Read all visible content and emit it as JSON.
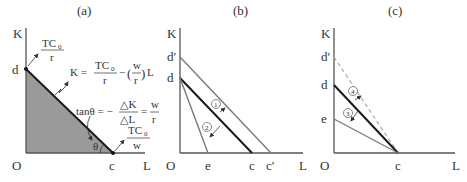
{
  "panels": {
    "a": {
      "title": "(a)",
      "axis_y": "K",
      "axis_x": "L",
      "origin": "O",
      "point_d": "d",
      "point_c": "c",
      "intercept_d_num": "TC",
      "intercept_d_sub": "0",
      "intercept_d_den": "r",
      "intercept_c_num": "TC",
      "intercept_c_sub": "0",
      "intercept_c_den": "w",
      "eq_lhs": "K =",
      "eq_frac_num": "TC",
      "eq_frac_sub": "0",
      "eq_frac_den": "r",
      "eq_minus": "−",
      "eq_w": "w",
      "eq_r": "r",
      "eq_L": "L",
      "tan_lhs": "tanθ = −",
      "tan_num": "△K",
      "tan_den": "△L",
      "tan_eq": "=",
      "tan_w": "w",
      "tan_r": "r",
      "theta": "θ"
    },
    "b": {
      "title": "(b)",
      "axis_y": "K",
      "axis_x": "L",
      "origin": "O",
      "point_d_prime": "d′",
      "point_d": "d",
      "point_e": "e",
      "point_c": "c",
      "point_c_prime": "c′",
      "marker_1": "1",
      "marker_2": "2"
    },
    "c": {
      "title": "(c)",
      "axis_y": "K",
      "axis_x": "L",
      "origin": "O",
      "point_d_prime": "d′",
      "point_d": "d",
      "point_e": "e",
      "point_c": "c",
      "marker_3": "3",
      "marker_4": "4"
    }
  },
  "colors": {
    "axis": "#555555",
    "budget_line": "#1a1a1a",
    "shifted_line": "#7a7a7a",
    "dashed_line": "#b0b0b0",
    "shade": "#9a9a9a"
  }
}
